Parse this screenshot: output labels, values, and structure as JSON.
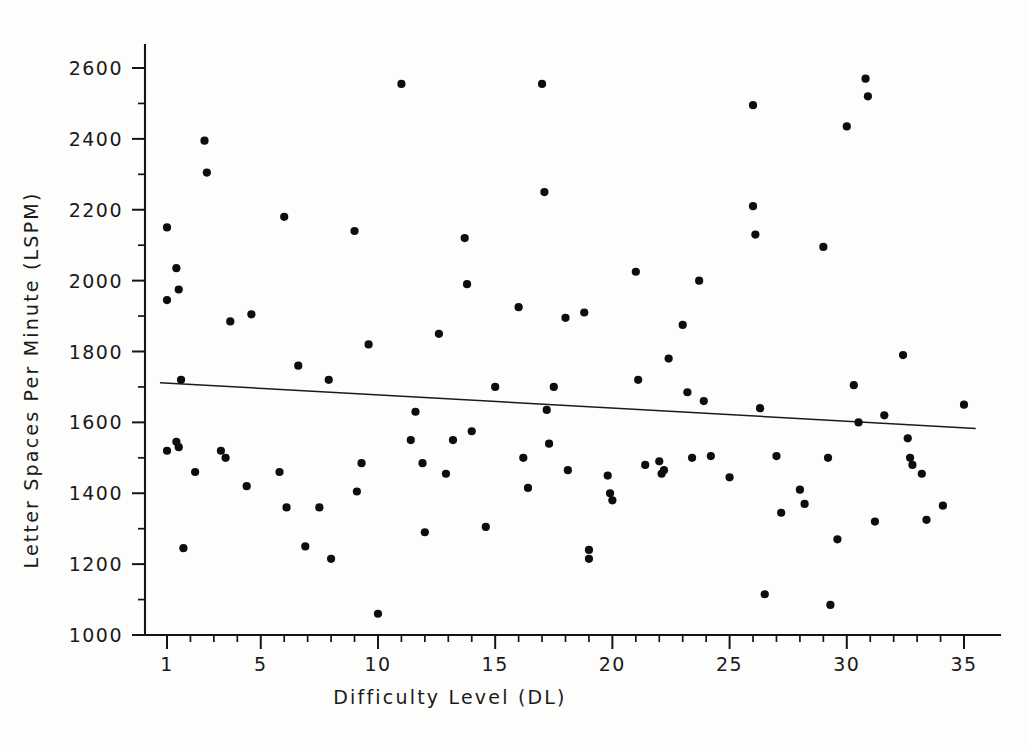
{
  "chart_data": {
    "type": "scatter",
    "title": "",
    "xlabel": "Difficulty Level (DL)",
    "ylabel": "Letter Spaces Per Minute (LSPM)",
    "xlim": [
      0,
      36
    ],
    "ylim": [
      1000,
      2650
    ],
    "grid": false,
    "legend": null,
    "x_tick_labels": [
      "1",
      "5",
      "10",
      "15",
      "20",
      "25",
      "30",
      "35"
    ],
    "x_tick_values": [
      1,
      5,
      10,
      15,
      20,
      25,
      30,
      35
    ],
    "x_minor_tick_values": [
      2,
      3,
      4,
      6,
      7,
      8,
      9,
      11,
      12,
      13,
      14,
      16,
      17,
      18,
      19,
      21,
      22,
      23,
      24,
      26,
      27,
      28,
      29,
      31,
      32,
      33,
      34
    ],
    "y_tick_labels": [
      "1000",
      "1200",
      "1400",
      "1600",
      "1800",
      "2000",
      "2200",
      "2400",
      "2600"
    ],
    "y_tick_values": [
      1000,
      1200,
      1400,
      1600,
      1800,
      2000,
      2200,
      2400,
      2600
    ],
    "y_minor_tick_values": [
      1100,
      1300,
      1500,
      1700,
      1900,
      2100,
      2300,
      2500
    ],
    "marker": "filled-circle",
    "marker_color": "#0d0d0d",
    "marker_size_px": 7,
    "points": [
      {
        "x": 1,
        "y": 2150
      },
      {
        "x": 1,
        "y": 1945
      },
      {
        "x": 1,
        "y": 1520
      },
      {
        "x": 1.4,
        "y": 2035
      },
      {
        "x": 1.4,
        "y": 1545
      },
      {
        "x": 1.5,
        "y": 1975
      },
      {
        "x": 1.5,
        "y": 1530
      },
      {
        "x": 1.6,
        "y": 1720
      },
      {
        "x": 1.7,
        "y": 1245
      },
      {
        "x": 2.2,
        "y": 1460
      },
      {
        "x": 2.6,
        "y": 2395
      },
      {
        "x": 2.7,
        "y": 2305
      },
      {
        "x": 3.3,
        "y": 1520
      },
      {
        "x": 3.5,
        "y": 1500
      },
      {
        "x": 3.7,
        "y": 1885
      },
      {
        "x": 4.4,
        "y": 1420
      },
      {
        "x": 4.6,
        "y": 1905
      },
      {
        "x": 5.8,
        "y": 1460
      },
      {
        "x": 6.0,
        "y": 2180
      },
      {
        "x": 6.1,
        "y": 1360
      },
      {
        "x": 6.6,
        "y": 1760
      },
      {
        "x": 6.9,
        "y": 1250
      },
      {
        "x": 7.5,
        "y": 1360
      },
      {
        "x": 7.9,
        "y": 1720
      },
      {
        "x": 8.0,
        "y": 1215
      },
      {
        "x": 9.0,
        "y": 2140
      },
      {
        "x": 9.1,
        "y": 1405
      },
      {
        "x": 9.3,
        "y": 1485
      },
      {
        "x": 9.6,
        "y": 1820
      },
      {
        "x": 10.0,
        "y": 1060
      },
      {
        "x": 11.0,
        "y": 2555
      },
      {
        "x": 11.4,
        "y": 1550
      },
      {
        "x": 11.6,
        "y": 1630
      },
      {
        "x": 11.9,
        "y": 1485
      },
      {
        "x": 12.0,
        "y": 1290
      },
      {
        "x": 12.6,
        "y": 1850
      },
      {
        "x": 12.9,
        "y": 1455
      },
      {
        "x": 13.2,
        "y": 1550
      },
      {
        "x": 13.7,
        "y": 2120
      },
      {
        "x": 13.8,
        "y": 1990
      },
      {
        "x": 14.0,
        "y": 1575
      },
      {
        "x": 14.6,
        "y": 1305
      },
      {
        "x": 15.0,
        "y": 1700
      },
      {
        "x": 16.0,
        "y": 1925
      },
      {
        "x": 16.2,
        "y": 1500
      },
      {
        "x": 16.4,
        "y": 1415
      },
      {
        "x": 17.0,
        "y": 2555
      },
      {
        "x": 17.1,
        "y": 2250
      },
      {
        "x": 17.2,
        "y": 1635
      },
      {
        "x": 17.3,
        "y": 1540
      },
      {
        "x": 17.5,
        "y": 1700
      },
      {
        "x": 18.0,
        "y": 1895
      },
      {
        "x": 18.1,
        "y": 1465
      },
      {
        "x": 18.8,
        "y": 1910
      },
      {
        "x": 19.0,
        "y": 1240
      },
      {
        "x": 19.0,
        "y": 1215
      },
      {
        "x": 19.8,
        "y": 1450
      },
      {
        "x": 19.9,
        "y": 1400
      },
      {
        "x": 20.0,
        "y": 1380
      },
      {
        "x": 21.0,
        "y": 2025
      },
      {
        "x": 21.1,
        "y": 1720
      },
      {
        "x": 21.4,
        "y": 1480
      },
      {
        "x": 22.0,
        "y": 1490
      },
      {
        "x": 22.1,
        "y": 1455
      },
      {
        "x": 22.2,
        "y": 1465
      },
      {
        "x": 22.4,
        "y": 1780
      },
      {
        "x": 23.0,
        "y": 1875
      },
      {
        "x": 23.2,
        "y": 1685
      },
      {
        "x": 23.4,
        "y": 1500
      },
      {
        "x": 23.7,
        "y": 2000
      },
      {
        "x": 23.9,
        "y": 1660
      },
      {
        "x": 24.2,
        "y": 1505
      },
      {
        "x": 25.0,
        "y": 1445
      },
      {
        "x": 26.0,
        "y": 2495
      },
      {
        "x": 26.0,
        "y": 2210
      },
      {
        "x": 26.1,
        "y": 2130
      },
      {
        "x": 26.3,
        "y": 1640
      },
      {
        "x": 26.5,
        "y": 1115
      },
      {
        "x": 27.0,
        "y": 1505
      },
      {
        "x": 27.2,
        "y": 1345
      },
      {
        "x": 28.0,
        "y": 1410
      },
      {
        "x": 28.2,
        "y": 1370
      },
      {
        "x": 29.0,
        "y": 2095
      },
      {
        "x": 29.2,
        "y": 1500
      },
      {
        "x": 29.3,
        "y": 1085
      },
      {
        "x": 29.6,
        "y": 1270
      },
      {
        "x": 30.0,
        "y": 2435
      },
      {
        "x": 30.3,
        "y": 1705
      },
      {
        "x": 30.5,
        "y": 1600
      },
      {
        "x": 30.8,
        "y": 2570
      },
      {
        "x": 30.9,
        "y": 2520
      },
      {
        "x": 31.2,
        "y": 1320
      },
      {
        "x": 31.6,
        "y": 1620
      },
      {
        "x": 32.4,
        "y": 1790
      },
      {
        "x": 32.6,
        "y": 1555
      },
      {
        "x": 32.7,
        "y": 1500
      },
      {
        "x": 32.8,
        "y": 1480
      },
      {
        "x": 33.2,
        "y": 1455
      },
      {
        "x": 33.4,
        "y": 1325
      },
      {
        "x": 34.1,
        "y": 1365
      },
      {
        "x": 35.0,
        "y": 1650
      }
    ],
    "regression_line": {
      "label": "least-squares fit",
      "x_start": 0.7,
      "y_start": 1712,
      "x_end": 35.5,
      "y_end": 1583,
      "color": "#1b1b1b"
    }
  }
}
